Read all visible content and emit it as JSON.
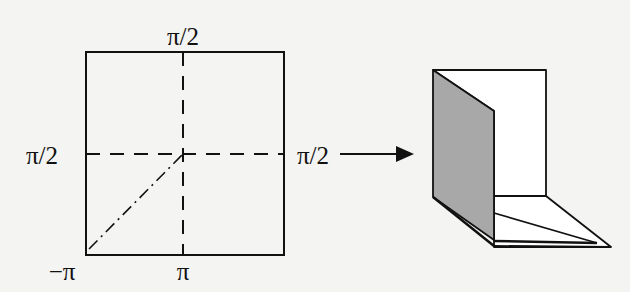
{
  "diagram": {
    "square": {
      "labels": {
        "top": "π/2",
        "left": "π/2",
        "right": "π/2",
        "bottom_left": "−π",
        "bottom": "π"
      },
      "lines": [
        "dashed-vertical",
        "dashed-horizontal",
        "dash-dot-diagonal"
      ]
    },
    "arrow": {
      "direction": "right"
    },
    "folded_figure": {
      "shaded_panel_color": "#a8a8a8",
      "panel_color": "#ffffff",
      "stroke_color": "#111111"
    }
  }
}
